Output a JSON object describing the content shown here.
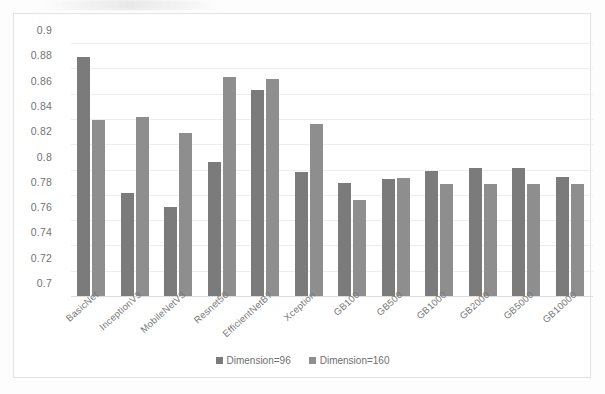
{
  "chart_data": {
    "type": "bar",
    "title": "",
    "xlabel": "",
    "ylabel": "",
    "ylim": [
      0.7,
      0.9
    ],
    "yticks": [
      "0.9",
      "0.88",
      "0.86",
      "0.84",
      "0.82",
      "0.8",
      "0.78",
      "0.76",
      "0.74",
      "0.72",
      "0.7"
    ],
    "ytick_values": [
      0.9,
      0.88,
      0.86,
      0.84,
      0.82,
      0.8,
      0.78,
      0.76,
      0.74,
      0.72,
      0.7
    ],
    "grid": true,
    "legend_position": "bottom",
    "categories": [
      "BasicNet",
      "InceptionV3",
      "MobileNetV3",
      "Resnet50",
      "EfficientNetB7",
      "Xception",
      "GB100",
      "GB500",
      "GB1000",
      "GB2000",
      "GB5000",
      "GB10000"
    ],
    "series": [
      {
        "name": "Dimension=96",
        "color": "#7b7b7b",
        "values": [
          0.89,
          0.782,
          0.771,
          0.807,
          0.864,
          0.799,
          0.79,
          0.793,
          0.8,
          0.802,
          0.802,
          0.795
        ]
      },
      {
        "name": "Dimension=160",
        "color": "#8e8e8e",
        "values": [
          0.84,
          0.842,
          0.83,
          0.874,
          0.872,
          0.837,
          0.777,
          0.794,
          0.789,
          0.789,
          0.789,
          0.789
        ]
      }
    ]
  },
  "legend": {
    "items": [
      {
        "label": "Dimension=96"
      },
      {
        "label": "Dimension=160"
      }
    ]
  }
}
